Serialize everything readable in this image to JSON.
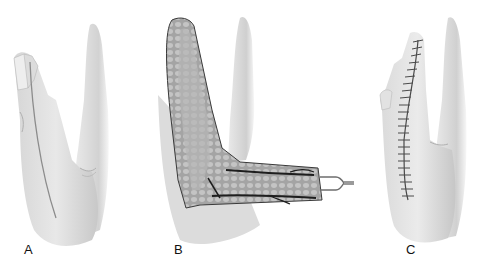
{
  "figure": {
    "panels": [
      {
        "label": "A",
        "description": "hand with incision line along finger and palm"
      },
      {
        "label": "B",
        "description": "elevated flap with vessels and drain"
      },
      {
        "label": "C",
        "description": "sutured closure along finger"
      }
    ],
    "colors": {
      "skin": "#e4e4e4",
      "skin_shadow": "#bdbdbd",
      "outline": "#3a3a3a",
      "flap_fill": "#a9a9a9",
      "vessel": "#1e1e1e",
      "suture": "#4a4a4a"
    }
  }
}
